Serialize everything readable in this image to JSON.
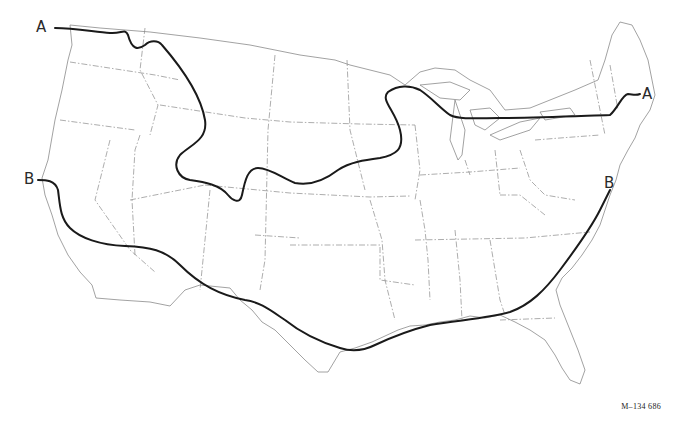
{
  "map": {
    "subject": "Contiguous United States",
    "style": "black-and-white line map",
    "lines": [
      {
        "id": "A",
        "label": "A",
        "description": "Northern boundary line from Pacific Northwest across northern plains to New England",
        "color": "#1a1a1a"
      },
      {
        "id": "B",
        "label": "B",
        "description": "Southern boundary line from central California across the southern states to Virginia coast",
        "color": "#1a1a1a"
      }
    ],
    "labels": {
      "line_a_west": "A",
      "line_a_east": "A",
      "line_b_west": "B",
      "line_b_east": "B"
    },
    "figure_id": "M–134 686"
  }
}
